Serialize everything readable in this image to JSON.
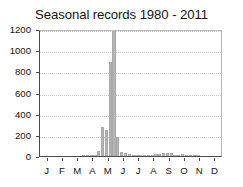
{
  "chart_data": {
    "type": "bar",
    "title": "Seasonal records 1980 - 2011",
    "xlabel": "",
    "ylabel": "",
    "ylim": [
      0,
      1200
    ],
    "yticks": [
      0,
      200,
      400,
      600,
      800,
      1000,
      1200
    ],
    "xtick_labels": [
      "J",
      "F",
      "M",
      "A",
      "M",
      "J",
      "J",
      "A",
      "S",
      "O",
      "N",
      "D"
    ],
    "xtick_positions": [
      0.5,
      1.5,
      2.5,
      3.5,
      4.5,
      5.5,
      6.5,
      7.5,
      8.5,
      9.5,
      10.5,
      11.5
    ],
    "xlim": [
      0,
      12
    ],
    "grid": true,
    "grid_axis": "y",
    "legend": "none",
    "bar_color": "#b6b6b6",
    "axis_color": "#4a4a4a",
    "grid_color": "#c9c9c9",
    "bin_unit": "month_fraction",
    "bin_width": 0.25,
    "categories": [
      "Jan 1",
      "Jan 2",
      "Jan 3",
      "Jan 4",
      "Feb 1",
      "Feb 2",
      "Feb 3",
      "Feb 4",
      "Mar 1",
      "Mar 2",
      "Mar 3",
      "Mar 4",
      "Apr 1",
      "Apr 2",
      "Apr 3",
      "Apr 4",
      "May 1",
      "May 2",
      "May 3",
      "May 4",
      "Jun 1",
      "Jun 2",
      "Jun 3",
      "Jun 4",
      "Jul 1",
      "Jul 2",
      "Jul 3",
      "Jul 4",
      "Aug 1",
      "Aug 2",
      "Aug 3",
      "Aug 4",
      "Sep 1",
      "Sep 2",
      "Sep 3",
      "Sep 4",
      "Oct 1",
      "Oct 2",
      "Oct 3",
      "Oct 4",
      "Nov 1",
      "Nov 2",
      "Nov 3",
      "Nov 4",
      "Dec 1",
      "Dec 2",
      "Dec 3",
      "Dec 4"
    ],
    "values": [
      0,
      0,
      0,
      0,
      0,
      0,
      0,
      0,
      0,
      0,
      0,
      2,
      3,
      5,
      10,
      45,
      270,
      250,
      890,
      1190,
      175,
      40,
      25,
      15,
      10,
      8,
      6,
      5,
      5,
      8,
      22,
      18,
      28,
      32,
      30,
      14,
      12,
      16,
      6,
      3,
      2,
      1,
      0,
      0,
      0,
      0,
      0,
      0
    ],
    "annotations": {
      "peak_label": "1190",
      "peak_category": "May 4",
      "secondary_peak_label": "890",
      "secondary_peak_category": "May 3"
    }
  },
  "figure": {
    "background": "#ffffff",
    "width": 243,
    "height": 187
  }
}
